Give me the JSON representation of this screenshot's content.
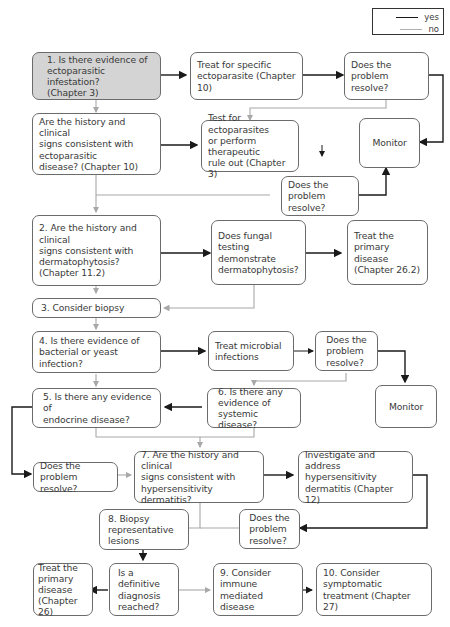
{
  "legend": {
    "yes": {
      "label": "yes",
      "color": "#1a1a1a"
    },
    "no": {
      "label": "no",
      "color": "#b0b0b0"
    }
  },
  "nodes": {
    "q1": "1. Is there evidence of\nectoparasitic infestation?\n(Chapter 3)",
    "treat_ecto": "Treat for specific\nectoparasite (Chapter 10)",
    "resolve_a": "Does the problem\nresolve?",
    "history_ecto": "Are the history and clinical\nsigns consistent with\nectoparasitic\ndisease? (Chapter 10)",
    "test_ecto": "Test for ectoparasites\nor perform therapeutic\nrule out (Chapter 3)",
    "monitor_a": "Monitor",
    "resolve_b": "Does the problem\nresolve?",
    "q2": "2. Are the history and clinical\nsigns consistent with\ndermatophytosis?\n(Chapter 11.2)",
    "fungal": "Does fungal testing\ndemonstrate\ndermatophytosis?",
    "treat_primary_a": "Treat the primary\ndisease\n(Chapter 26.2)",
    "q3": "3. Consider biopsy",
    "q4": "4. Is there evidence of\nbacterial or yeast infection?",
    "treat_microbial": "Treat microbial\ninfections",
    "resolve_c": "Does the\nproblem\nresolve?",
    "monitor_b": "Monitor",
    "q5": "5. Is there any evidence of\nendocrine disease?",
    "q6": "6. Is there any\nevidence of\nsystemic disease?",
    "resolve_d": "Does the problem\nresolve?",
    "q7": "7. Are the history and clinical\nsigns consistent with\nhypersensitivity dermatitis?",
    "investigate_hyper": "Investigate and address\nhypersensitivity\ndermatitis (Chapter 12)",
    "q8": "8. Biopsy\nrepresentative\nlesions",
    "resolve_e": "Does the\nproblem\nresolve?",
    "treat_primary_b": "Treat the\nprimary\ndisease\n(Chapter 26)",
    "definitive": "Is a definitive\ndiagnosis\nreached?",
    "q9": "9. Consider\nimmune mediated\ndisease",
    "q10": "10. Consider symptomatic\ntreatment (Chapter 27)"
  }
}
